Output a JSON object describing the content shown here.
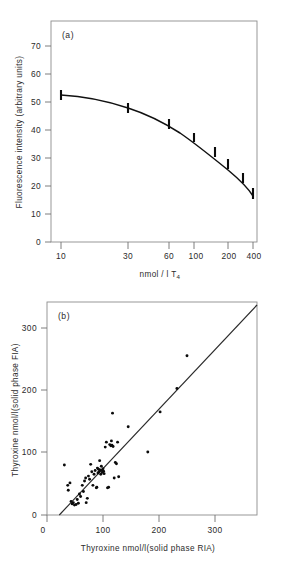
{
  "figure": {
    "panel_a_label": "(a)",
    "panel_b_label": "(b)"
  },
  "chart_data": [
    {
      "type": "line",
      "panel": "(a)",
      "title": "",
      "xlabel": "nmol/l T4",
      "xlabel_main": "nmol / l T",
      "xlabel_sub": "4",
      "ylabel": "Fluorescence intensity (arbitrary units)",
      "xscale": "log",
      "xlim": [
        8,
        480
      ],
      "ylim": [
        0,
        75
      ],
      "xticks": [
        10,
        30,
        60,
        100,
        200,
        400
      ],
      "xticklabels": [
        "10",
        "30",
        "60",
        "100",
        "200",
        "400"
      ],
      "yticks": [
        0,
        10,
        20,
        30,
        40,
        50,
        60,
        70
      ],
      "yticklabels": [
        "0",
        "10",
        "20",
        "30",
        "40",
        "50",
        "60",
        "70"
      ],
      "grid": false,
      "legend": "none",
      "x": [
        10,
        30,
        60,
        100,
        150,
        200,
        300,
        400
      ],
      "values": [
        52.5,
        48.3,
        42.4,
        37.6,
        32.5,
        28.6,
        23.6,
        19.4
      ],
      "yerr": [
        1.0,
        0.9,
        0.9,
        0.9,
        0.9,
        0.9,
        0.9,
        1.0
      ],
      "marker": "error-bar"
    },
    {
      "type": "scatter",
      "panel": "(b)",
      "title": "",
      "xlabel": "Thyroxine nmol/l(solid phase RIA)",
      "ylabel": "Thyroxine nmol/l(solid phase FIA)",
      "xscale": "linear",
      "xlim": [
        0,
        375
      ],
      "ylim": [
        0,
        345
      ],
      "xticks": [
        0,
        100,
        200,
        300
      ],
      "xticklabels": [
        "0",
        "100",
        "200",
        "300"
      ],
      "yticks": [
        0,
        100,
        200,
        300
      ],
      "yticklabels": [
        "0",
        "100",
        "200",
        "300"
      ],
      "grid": false,
      "legend": "none",
      "regression_line": {
        "x": [
          22,
          375
        ],
        "y": [
          0,
          338
        ]
      },
      "points": [
        [
          31,
          81
        ],
        [
          37,
          48
        ],
        [
          38,
          40
        ],
        [
          41,
          52
        ],
        [
          43,
          22
        ],
        [
          45,
          18
        ],
        [
          47,
          20
        ],
        [
          49,
          16
        ],
        [
          52,
          17
        ],
        [
          54,
          25
        ],
        [
          56,
          19
        ],
        [
          58,
          34
        ],
        [
          60,
          30
        ],
        [
          63,
          48
        ],
        [
          65,
          38
        ],
        [
          67,
          55
        ],
        [
          69,
          60
        ],
        [
          70,
          20
        ],
        [
          72,
          27
        ],
        [
          74,
          63
        ],
        [
          76,
          58
        ],
        [
          78,
          82
        ],
        [
          80,
          70
        ],
        [
          82,
          48
        ],
        [
          84,
          66
        ],
        [
          86,
          72
        ],
        [
          88,
          44
        ],
        [
          89,
          45
        ],
        [
          90,
          76
        ],
        [
          91,
          68
        ],
        [
          92,
          74
        ],
        [
          93,
          70
        ],
        [
          94,
          88
        ],
        [
          95,
          73
        ],
        [
          96,
          66
        ],
        [
          97,
          79
        ],
        [
          98,
          72
        ],
        [
          99,
          69
        ],
        [
          100,
          75
        ],
        [
          101,
          71
        ],
        [
          102,
          67
        ],
        [
          104,
          110
        ],
        [
          106,
          118
        ],
        [
          108,
          44
        ],
        [
          110,
          45
        ],
        [
          112,
          114
        ],
        [
          114,
          112
        ],
        [
          115,
          120
        ],
        [
          116,
          113
        ],
        [
          117,
          165
        ],
        [
          118,
          111
        ],
        [
          120,
          60
        ],
        [
          122,
          85
        ],
        [
          124,
          83
        ],
        [
          126,
          118
        ],
        [
          128,
          62
        ],
        [
          145,
          143
        ],
        [
          180,
          102
        ],
        [
          202,
          167
        ],
        [
          232,
          205
        ],
        [
          250,
          258
        ]
      ]
    }
  ]
}
